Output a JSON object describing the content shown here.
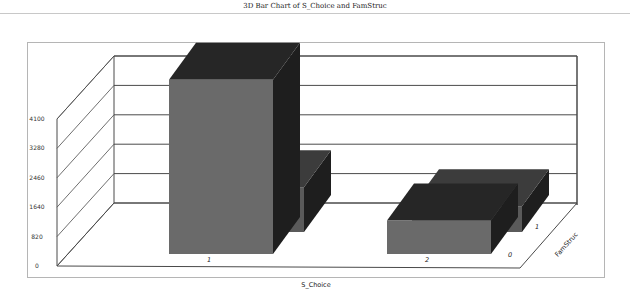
{
  "chart_data": {
    "type": "bar",
    "subtype": "3d-bar",
    "title": "3D Bar Chart of S_Choice and FamStruc",
    "xlabel": "S_Choice",
    "zlabel": "FamStruc",
    "ylabel": "",
    "categories": [
      "1",
      "2"
    ],
    "depth_categories": [
      "0",
      "1"
    ],
    "series": [
      {
        "name": "0",
        "values": [
          4460,
          860
        ]
      },
      {
        "name": "1",
        "values": [
          1250,
          720
        ]
      }
    ],
    "y_ticks": [
      "0",
      "820",
      "1640",
      "2460",
      "3280",
      "4100"
    ],
    "ylim": [
      0,
      4100
    ],
    "grid": true,
    "legend": "none",
    "colors": {
      "front": "#6a6a6a",
      "top": "#262626",
      "side": "#1e1e1e",
      "back_front": "#5a5a5a",
      "back_top": "#3c3c3c",
      "grid": "#4a4a4a",
      "frame": "#b5b5b5"
    }
  }
}
